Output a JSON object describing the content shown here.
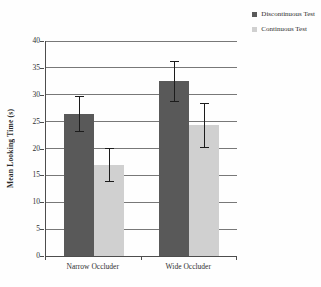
{
  "chart_data": {
    "type": "bar",
    "title": "",
    "xlabel": "",
    "ylabel": "Mean Looking Time (s)",
    "categories": [
      "Narrow Occluder",
      "Wide Occluder"
    ],
    "series": [
      {
        "name": "Discontinuous Test",
        "color": "#595959",
        "values": [
          26.5,
          32.6
        ],
        "errors": [
          3.2,
          3.7
        ]
      },
      {
        "name": "Continuous Test",
        "color": "#d0d0d0",
        "values": [
          17.0,
          24.4
        ],
        "errors": [
          3.1,
          4.1
        ]
      }
    ],
    "ylim": [
      0,
      40
    ],
    "ytick_step": 5,
    "grid": true,
    "legend_position": "top-right",
    "error_bars": true,
    "colors": {
      "grid": "#787878",
      "axis": "#4d4d4d",
      "error_bar": "#1c1c1c",
      "text": "#2e2e2e",
      "background": "#fefefe"
    }
  }
}
